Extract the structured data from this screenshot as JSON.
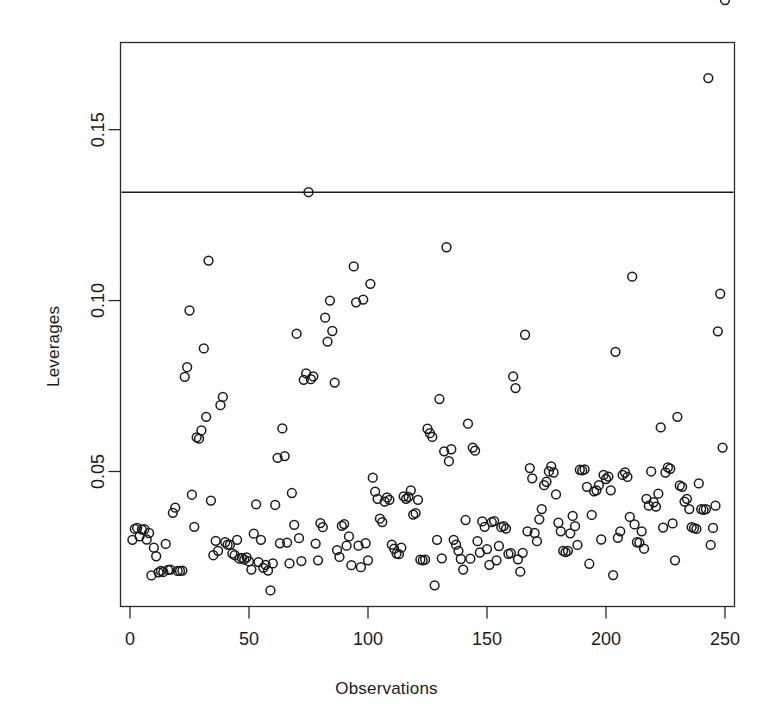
{
  "chart_data": {
    "type": "scatter",
    "title": "",
    "xlabel": "Observations",
    "ylabel": "Leverages",
    "xlim": [
      -4,
      254
    ],
    "ylim": [
      0.0105,
      0.1755
    ],
    "xticks": [
      0,
      50,
      100,
      150,
      200,
      250
    ],
    "xticklabels": [
      "0",
      "50",
      "100",
      "150",
      "200",
      "250"
    ],
    "yticks": [
      0.05,
      0.1,
      0.15
    ],
    "yticklabels": [
      "0.05",
      "0.10",
      "0.15"
    ],
    "grid": false,
    "legend": null,
    "marker": "open-circle",
    "marker_color": "#1a1a1a",
    "point_radius_px": 4.4,
    "threshold_line": {
      "orientation": "horizontal",
      "y": 0.1317,
      "color": "#1a1a1a",
      "label": ""
    },
    "x": [
      1,
      2,
      3,
      4,
      5,
      6,
      7,
      8,
      9,
      10,
      11,
      12,
      13,
      14,
      15,
      16,
      17,
      18,
      19,
      20,
      21,
      22,
      23,
      24,
      25,
      26,
      27,
      28,
      29,
      30,
      31,
      32,
      33,
      34,
      35,
      36,
      37,
      38,
      39,
      40,
      41,
      42,
      43,
      44,
      45,
      46,
      47,
      48,
      49,
      50,
      51,
      52,
      53,
      54,
      55,
      56,
      57,
      58,
      59,
      60,
      61,
      62,
      63,
      64,
      65,
      66,
      67,
      68,
      69,
      70,
      71,
      72,
      73,
      74,
      75,
      76,
      77,
      78,
      79,
      80,
      81,
      82,
      83,
      84,
      85,
      86,
      87,
      88,
      89,
      90,
      91,
      92,
      93,
      94,
      95,
      96,
      97,
      98,
      99,
      100,
      101,
      102,
      103,
      104,
      105,
      106,
      107,
      108,
      109,
      110,
      111,
      112,
      113,
      114,
      115,
      116,
      117,
      118,
      119,
      120,
      121,
      122,
      123,
      124,
      125,
      126,
      127,
      128,
      129,
      130,
      131,
      132,
      133,
      134,
      135,
      136,
      137,
      138,
      139,
      140,
      141,
      142,
      143,
      144,
      145,
      146,
      147,
      148,
      149,
      150,
      151,
      152,
      153,
      154,
      155,
      156,
      157,
      158,
      159,
      160,
      161,
      162,
      163,
      164,
      165,
      166,
      167,
      168,
      169,
      170,
      171,
      172,
      173,
      174,
      175,
      176,
      177,
      178,
      179,
      180,
      181,
      182,
      183,
      184,
      185,
      186,
      187,
      188,
      189,
      190,
      191,
      192,
      193,
      194,
      195,
      196,
      197,
      198,
      199,
      200,
      201,
      202,
      203,
      204,
      205,
      206,
      207,
      208,
      209,
      210,
      211,
      212,
      213,
      214,
      215,
      216,
      217,
      218,
      219,
      220,
      221,
      222,
      223,
      224,
      225,
      226,
      227,
      228,
      229,
      230,
      231,
      232,
      233,
      234,
      235,
      236,
      237,
      238,
      239,
      240,
      241,
      242,
      243,
      244,
      245,
      246,
      247,
      248,
      249,
      250
    ],
    "y": [
      0.03,
      0.0332,
      0.0335,
      0.031,
      0.033,
      0.0331,
      0.0301,
      0.032,
      0.0196,
      0.0277,
      0.0252,
      0.0205,
      0.0209,
      0.0206,
      0.0288,
      0.0212,
      0.0213,
      0.0379,
      0.0394,
      0.0209,
      0.0209,
      0.021,
      0.0777,
      0.0805,
      0.0971,
      0.0432,
      0.0338,
      0.06,
      0.0596,
      0.062,
      0.086,
      0.066,
      0.1117,
      0.0415,
      0.0255,
      0.0297,
      0.0268,
      0.0694,
      0.0718,
      0.0293,
      0.0286,
      0.0286,
      0.026,
      0.0255,
      0.03,
      0.0245,
      0.0247,
      0.0242,
      0.0249,
      0.0237,
      0.0213,
      0.0318,
      0.0404,
      0.0235,
      0.03,
      0.0218,
      0.0227,
      0.021,
      0.0152,
      0.0231,
      0.0402,
      0.054,
      0.029,
      0.0626,
      0.0545,
      0.0292,
      0.0231,
      0.0437,
      0.0344,
      0.0903,
      0.0305,
      0.0238,
      0.0768,
      0.0787,
      0.1317,
      0.077,
      0.0778,
      0.0289,
      0.024,
      0.0349,
      0.0337,
      0.095,
      0.088,
      0.1,
      0.0911,
      0.076,
      0.027,
      0.025,
      0.0341,
      0.0346,
      0.0283,
      0.031,
      0.0226,
      0.11,
      0.0995,
      0.0283,
      0.022,
      0.1003,
      0.029,
      0.024,
      0.1049,
      0.0482,
      0.0441,
      0.042,
      0.0362,
      0.0352,
      0.0412,
      0.0424,
      0.0417,
      0.0286,
      0.0274,
      0.026,
      0.0258,
      0.0277,
      0.0427,
      0.042,
      0.0426,
      0.0445,
      0.0374,
      0.0378,
      0.0417,
      0.0242,
      0.024,
      0.0242,
      0.0625,
      0.0612,
      0.0601,
      0.0167,
      0.03,
      0.0712,
      0.0246,
      0.0559,
      0.1156,
      0.053,
      0.0565,
      0.03,
      0.0286,
      0.0268,
      0.0244,
      0.0213,
      0.0358,
      0.064,
      0.0245,
      0.057,
      0.0561,
      0.0296,
      0.0263,
      0.0354,
      0.0338,
      0.0273,
      0.0227,
      0.0352,
      0.0355,
      0.024,
      0.0282,
      0.0337,
      0.034,
      0.0333,
      0.0259,
      0.0261,
      0.0778,
      0.0744,
      0.0243,
      0.0207,
      0.0262,
      0.09,
      0.0325,
      0.051,
      0.048,
      0.032,
      0.0296,
      0.036,
      0.039,
      0.046,
      0.047,
      0.05,
      0.0515,
      0.0497,
      0.0433,
      0.035,
      0.0325,
      0.0268,
      0.0264,
      0.0268,
      0.0319,
      0.037,
      0.034,
      0.0285,
      0.0505,
      0.0503,
      0.0506,
      0.0455,
      0.023,
      0.0373,
      0.0442,
      0.0445,
      0.046,
      0.0301,
      0.049,
      0.0478,
      0.0485,
      0.0445,
      0.0197,
      0.085,
      0.0306,
      0.0325,
      0.049,
      0.0497,
      0.0484,
      0.0367,
      0.107,
      0.0345,
      0.0293,
      0.0292,
      0.0325,
      0.0274,
      0.042,
      0.04,
      0.05,
      0.041,
      0.0397,
      0.0435,
      0.0629,
      0.0336,
      0.0497,
      0.0512,
      0.0508,
      0.0348,
      0.024,
      0.066,
      0.0459,
      0.0455,
      0.0412,
      0.042,
      0.039,
      0.0337,
      0.0334,
      0.0332,
      0.0465,
      0.039,
      0.0388,
      0.039,
      0.1651,
      0.0285,
      0.0335,
      0.04,
      0.091,
      0.102,
      0.057
    ]
  }
}
